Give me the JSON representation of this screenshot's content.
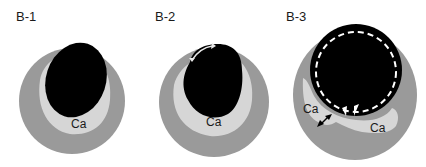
{
  "figure": {
    "panels": [
      {
        "id": "B-1",
        "label": "B-1",
        "calcium_labels": [
          "Ca"
        ],
        "has_rotation_arrow": false,
        "has_dashed_circle": false
      },
      {
        "id": "B-2",
        "label": "B-2",
        "calcium_labels": [
          "Ca"
        ],
        "has_rotation_arrow": true,
        "has_dashed_circle": false
      },
      {
        "id": "B-3",
        "label": "B-3",
        "calcium_labels": [
          "Ca",
          "Ca"
        ],
        "has_rotation_arrow": false,
        "has_dashed_circle": true,
        "has_double_arrow": true,
        "has_crack_marks": true
      }
    ],
    "colors": {
      "vessel_wall": "#9a9a9a",
      "calcium": "#d6d6d6",
      "lumen": "#000000",
      "arrow": "#e8e8e8",
      "dashed_circle": "#ffffff"
    }
  }
}
